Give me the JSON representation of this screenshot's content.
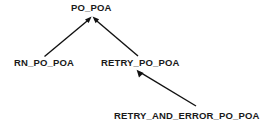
{
  "diagram": {
    "background_color": "#ffffff",
    "text_color": "#1a1a1a",
    "edge_color": "#111111",
    "nodes": [
      {
        "id": "po_poa",
        "label": "PO_POA"
      },
      {
        "id": "rn_po_poa",
        "label": "RN_PO_POA"
      },
      {
        "id": "retry_po_poa",
        "label": "RETRY_PO_POA"
      },
      {
        "id": "retry_and_error_po_poa",
        "label": "RETRY_AND_ERROR_PO_POA"
      }
    ],
    "edges": [
      {
        "from": "rn_po_poa",
        "to": "po_poa",
        "arrow": "to"
      },
      {
        "from": "retry_po_poa",
        "to": "po_poa",
        "arrow": "to"
      },
      {
        "from": "retry_and_error_po_poa",
        "to": "retry_po_poa",
        "arrow": "to"
      }
    ]
  }
}
